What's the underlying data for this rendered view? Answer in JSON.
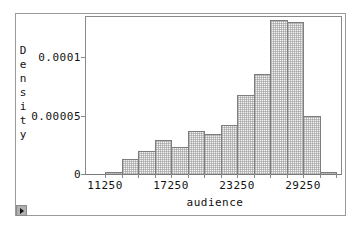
{
  "chart_data": {
    "type": "bar",
    "subtype": "histogram",
    "title": "",
    "xlabel": "audience",
    "ylabel": "Density",
    "bin_edges": [
      11250,
      12750,
      14250,
      15750,
      17250,
      18750,
      20250,
      21750,
      23250,
      24750,
      26250,
      27750,
      29250,
      30750,
      32250
    ],
    "categories": [
      "11250-12750",
      "12750-14250",
      "14250-15750",
      "15750-17250",
      "17250-18750",
      "18750-20250",
      "20250-21750",
      "21750-23250",
      "23250-24750",
      "24750-26250",
      "26250-27750",
      "27750-29250",
      "29250-30750",
      "30750-32250"
    ],
    "values": [
      1.3e-06,
      1.25e-05,
      1.97e-05,
      2.88e-05,
      2.31e-05,
      3.64e-05,
      3.36e-05,
      4.13e-05,
      6.69e-05,
      8.47e-05,
      0.0001307,
      0.000129,
      4.89e-05,
      1.3e-06
    ],
    "x_ticks": [
      "11250",
      "17250",
      "23250",
      "29250"
    ],
    "y_ticks": [
      "0",
      "0.00005",
      "0.0001"
    ],
    "ylim": [
      0,
      0.000135
    ],
    "grid": false,
    "legend": null
  },
  "axes": {
    "xlabel": "audience",
    "ylabel_letters": [
      "D",
      "e",
      "n",
      "s",
      "i",
      "t",
      "y"
    ],
    "x_ticks": [
      {
        "label": "11250",
        "x": 105
      },
      {
        "label": "17250",
        "x": 171
      },
      {
        "label": "23250",
        "x": 237
      },
      {
        "label": "29250",
        "x": 303
      }
    ],
    "y_ticks": [
      {
        "label": "0",
        "y": 174
      },
      {
        "label": "0.00005",
        "y": 116
      },
      {
        "label": "0.0001",
        "y": 57
      }
    ]
  },
  "controls": {
    "play_button": "play-icon"
  },
  "colors": {
    "bar_border": "#7d7d7d",
    "bar_fill_pattern": "#969696",
    "frame": "#9a9a9a"
  }
}
